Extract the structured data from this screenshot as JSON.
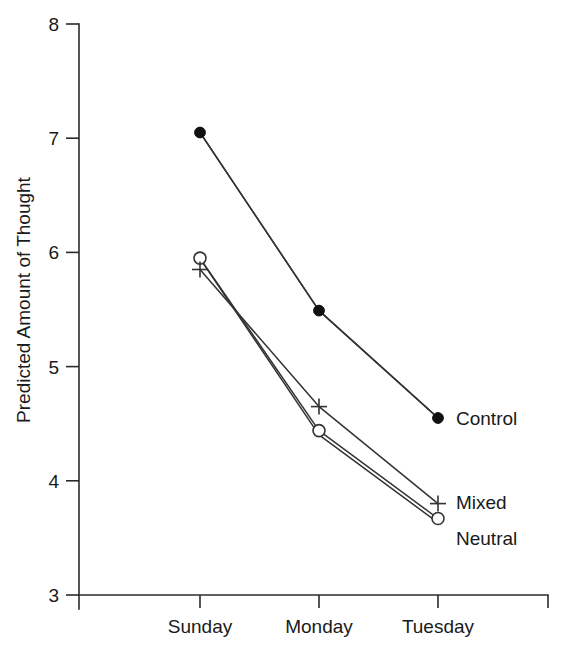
{
  "chart_data": {
    "type": "line",
    "title": "",
    "xlabel": "",
    "ylabel": "Predicted Amount of Thought",
    "categories": [
      "Sunday",
      "Monday",
      "Tuesday"
    ],
    "ylim": [
      3,
      8
    ],
    "yticks": [
      3,
      4,
      5,
      6,
      7,
      8
    ],
    "ytick_labels": [
      "3",
      "4",
      "5",
      "6",
      "7",
      "8"
    ],
    "grid": false,
    "legend_position": "inline-right",
    "series": [
      {
        "name": "Control",
        "marker": "filled-circle",
        "values": [
          7.05,
          5.49,
          4.55
        ],
        "label": "Control"
      },
      {
        "name": "Mixed",
        "marker": "plus",
        "values": [
          5.85,
          4.65,
          3.8
        ],
        "label": "Mixed"
      },
      {
        "name": "Neutral",
        "marker": "open-circle",
        "values": [
          5.95,
          4.44,
          3.67
        ],
        "label": "Neutral"
      }
    ],
    "colors": {
      "line": "#333333",
      "marker_fill": "#111111",
      "marker_open_fill": "#ffffff",
      "axis": "#2b2b2b",
      "text": "#1a1a1a",
      "background": "#ffffff"
    }
  },
  "axis": {
    "y_title": "Predicted Amount of Thought",
    "y_labels": [
      "8",
      "7",
      "6",
      "5",
      "4",
      "3"
    ],
    "x_labels": [
      "Sunday",
      "Monday",
      "Tuesday"
    ]
  },
  "labels": {
    "control": "Control",
    "mixed": "Mixed",
    "neutral": "Neutral"
  }
}
